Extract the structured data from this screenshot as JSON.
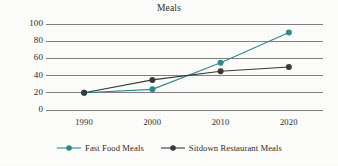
{
  "chart_data": {
    "type": "line",
    "title": "Meals",
    "xlabel": "",
    "ylabel": "",
    "categories": [
      "1990",
      "2000",
      "2010",
      "2020"
    ],
    "x": [
      1990,
      2000,
      2010,
      2020
    ],
    "ylim": [
      0,
      100
    ],
    "yticks": [
      "0",
      "20",
      "40",
      "60",
      "80",
      "100"
    ],
    "ytick_values": [
      0,
      20,
      40,
      60,
      80,
      100
    ],
    "grid": true,
    "legend_position": "bottom",
    "series": [
      {
        "name": "Fast Food Meals",
        "values": [
          20,
          24,
          55,
          90
        ],
        "color": "#2e8b8b",
        "marker": "circle"
      },
      {
        "name": "Sitdown Restaurant Meals",
        "values": [
          20,
          35,
          45,
          50
        ],
        "color": "#3a3a3a",
        "marker": "circle"
      }
    ]
  },
  "colors": {
    "fast_food": "#2e8b8b",
    "sitdown": "#3a3a3a",
    "gridline": "#808080",
    "text": "#2b2b2b",
    "background": "#fdfdfc"
  }
}
